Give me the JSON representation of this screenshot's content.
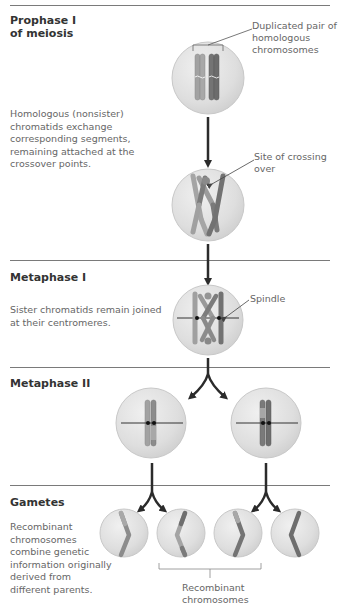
{
  "sections": [
    {
      "id": "prophase",
      "heading_line1": "Prophase I",
      "heading_line2": "of meiosis",
      "description": [
        "Homologous (nonsister)",
        "chromatids exchange",
        "corresponding segments,",
        "remaining attached at the",
        "crossover points."
      ],
      "labels": {
        "duplicated_pair": [
          "Duplicated pair of",
          "homologous",
          "chromosomes"
        ],
        "crossing_over": "Site of crossing over"
      }
    },
    {
      "id": "metaphase1",
      "heading": "Metaphase I",
      "description": [
        "Sister chromatids remain joined",
        "at their centromeres."
      ],
      "labels": {
        "spindle": "Spindle"
      }
    },
    {
      "id": "metaphase2",
      "heading": "Metaphase II"
    },
    {
      "id": "gametes",
      "heading": "Gametes",
      "description": [
        "Recombinant",
        "chromosomes",
        "combine genetic",
        "information originally",
        "derived from",
        "different parents."
      ],
      "labels": {
        "recombinant": [
          "Recombinant",
          "chromosomes"
        ]
      }
    }
  ],
  "colors": {
    "divider": "#7a7a7a",
    "cell_fill": "#e2e2e2",
    "cell_edge": "#c8c8c8",
    "chromosome_light": "#9a9a9a",
    "chromosome_dark": "#6e6e6e",
    "arrow": "#2b2b2b",
    "leader": "#555555"
  }
}
